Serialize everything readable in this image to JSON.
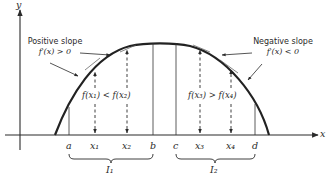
{
  "diagram": {
    "type": "calculus-monotonicity-illustration",
    "axes": {
      "x_label": "x",
      "y_label": "y"
    },
    "annotations": {
      "positive_slope": {
        "title": "Positive slope",
        "condition": "f′(x) > 0"
      },
      "negative_slope": {
        "title": "Negative slope",
        "condition": "f′(x) < 0"
      },
      "increasing_relation": "f(x₁) < f(x₂)",
      "decreasing_relation": "f(x₃) > f(x₄)"
    },
    "x_ticks": {
      "a": "a",
      "x1": "x₁",
      "x2": "x₂",
      "b": "b",
      "c": "c",
      "x3": "x₃",
      "x4": "x₄",
      "d": "d"
    },
    "intervals": {
      "I1": "I₁",
      "I2": "I₂"
    },
    "colors": {
      "ink": "#2a2a2a",
      "background": "#ffffff"
    }
  }
}
